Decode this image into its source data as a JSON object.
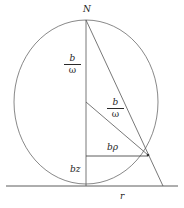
{
  "figure": {
    "background_color": "#ffffff",
    "stroke_color": "#4a4a4a",
    "text_color": "#1d1d1d"
  },
  "labels": {
    "apex": "N",
    "baseline": "r",
    "vertical_lower": "bz",
    "horizontal": "bρ",
    "fraction_upper": {
      "numerator": "b",
      "denominator": "ω"
    },
    "fraction_radius": {
      "numerator": "b",
      "denominator": "ω"
    }
  },
  "geometry": {
    "circle": {
      "cx": 86,
      "cy": 102,
      "r": 82
    },
    "baseline": {
      "x1": 6,
      "y1": 186,
      "x2": 178,
      "y2": 186
    },
    "vertical_axis": {
      "x1": 86,
      "y1": 20,
      "x2": 86,
      "y2": 186
    },
    "radius_segment": {
      "x1": 86,
      "y1": 102,
      "x2": 148,
      "y2": 155
    },
    "chord_from_apex": {
      "x1": 86,
      "y1": 20,
      "x2": 163,
      "y2": 186
    },
    "horizontal_segment": {
      "x1": 86,
      "y1": 156,
      "x2": 148,
      "y2": 156
    },
    "apex_point": {
      "x": 86,
      "y": 20
    },
    "circle_point": {
      "x": 148,
      "y": 155
    },
    "baseline_point": {
      "x": 163,
      "y": 186
    }
  }
}
